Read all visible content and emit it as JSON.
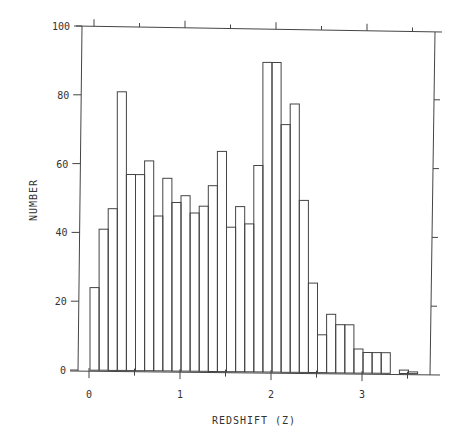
{
  "chart_data": {
    "type": "bar",
    "subtype": "histogram",
    "title": "",
    "xlabel": "REDSHIFT (Z)",
    "ylabel": "NUMBER",
    "xlim": [
      -0.1,
      3.8
    ],
    "ylim": [
      0,
      100
    ],
    "bin_width": 0.1,
    "x_ticks": [
      0,
      1,
      2,
      3
    ],
    "x_tick_labels": [
      "0",
      "1",
      "2",
      "3"
    ],
    "y_ticks": [
      0,
      20,
      40,
      60,
      80,
      100
    ],
    "y_tick_labels": [
      "0",
      "20",
      "40",
      "60",
      "80",
      "100"
    ],
    "grid": false,
    "legend": null,
    "categories": [
      "0.0",
      "0.1",
      "0.2",
      "0.3",
      "0.4",
      "0.5",
      "0.6",
      "0.7",
      "0.8",
      "0.9",
      "1.0",
      "1.1",
      "1.2",
      "1.3",
      "1.4",
      "1.5",
      "1.6",
      "1.7",
      "1.8",
      "1.9",
      "2.0",
      "2.1",
      "2.2",
      "2.3",
      "2.4",
      "2.5",
      "2.6",
      "2.7",
      "2.8",
      "2.9",
      "3.0",
      "3.1",
      "3.2",
      "3.3",
      "3.4",
      "3.5"
    ],
    "values": [
      24,
      41,
      47,
      81,
      57,
      57,
      61,
      45,
      56,
      49,
      51,
      46,
      48,
      54,
      64,
      42,
      48,
      43,
      60,
      90,
      90,
      72,
      78,
      50,
      26,
      11,
      17,
      14,
      14,
      7,
      6,
      6,
      6,
      0,
      1,
      0.5
    ]
  }
}
